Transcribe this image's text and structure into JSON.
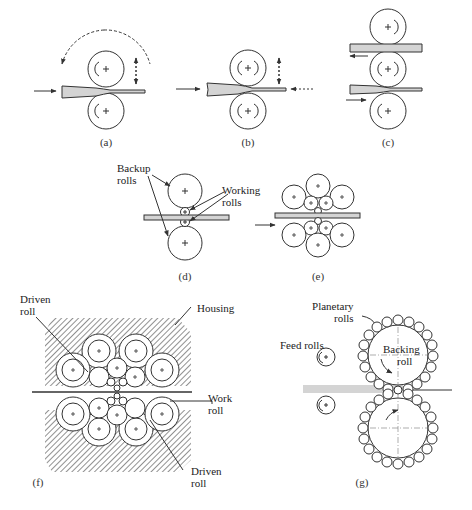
{
  "figure": {
    "type": "rolling-mill-configurations",
    "panels": [
      {
        "id": "a",
        "caption": "(a)",
        "description": "Two-high reversing mill"
      },
      {
        "id": "b",
        "caption": "(b)",
        "description": "Two-high mill, reverse feed"
      },
      {
        "id": "c",
        "caption": "(c)",
        "description": "Three-high mill"
      },
      {
        "id": "d",
        "caption": "(d)",
        "description": "Four-high mill"
      },
      {
        "id": "e",
        "caption": "(e)",
        "description": "Cluster mill"
      },
      {
        "id": "f",
        "caption": "(f)",
        "description": "Sendzimir mill"
      },
      {
        "id": "g",
        "caption": "(g)",
        "description": "Planetary mill"
      }
    ]
  },
  "labels": {
    "d_backup": "Backup\nrolls",
    "d_backup_1": "Backup",
    "d_backup_2": "rolls",
    "d_working_1": "Working",
    "d_working_2": "rolls",
    "f_driven_top_1": "Driven",
    "f_driven_top_2": "roll",
    "f_housing": "Housing",
    "f_work_1": "Work",
    "f_work_2": "roll",
    "f_driven_bot_1": "Driven",
    "f_driven_bot_2": "roll",
    "g_planetary_1": "Planetary",
    "g_planetary_2": "rolls",
    "g_backing_1": "Backing",
    "g_backing_2": "roll",
    "g_feed": "Feed rolls"
  },
  "colors": {
    "stroke": "#333333",
    "strip_fill": "#d4d4d4",
    "background": "#ffffff",
    "hatch": "#555555"
  }
}
